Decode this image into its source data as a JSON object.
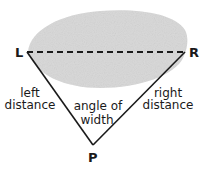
{
  "diagram": {
    "points": {
      "left": {
        "label": "L"
      },
      "right": {
        "label": "R"
      },
      "observer": {
        "label": "P"
      }
    },
    "labels": {
      "left_distance": [
        "left",
        "distance"
      ],
      "right_distance": [
        "right",
        "distance"
      ],
      "angle_of_width": [
        "angle of",
        "width"
      ]
    },
    "colors": {
      "object_fill": "#dcdcdc",
      "line": "#1a1a1a"
    }
  }
}
